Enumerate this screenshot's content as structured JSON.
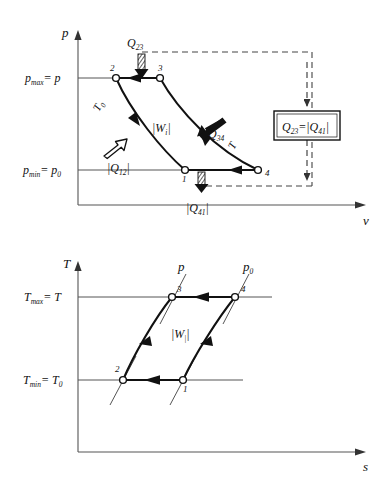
{
  "figure": {
    "type": "diagram",
    "background": "#ffffff",
    "line_color": "#111111",
    "dash_color": "#444444",
    "axis_color": "#555555"
  },
  "pv_chart": {
    "name": "p-v diagram",
    "x_axis_label": "v",
    "y_axis_label": "p",
    "y_ticks": [
      {
        "id": "pmax",
        "text_main": "p",
        "text_sub": "max",
        "text_eq": "= p",
        "value_y": 78
      },
      {
        "id": "pmin",
        "text_main": "p",
        "text_sub": "min",
        "text_eq": "= p",
        "text_eq_sub": "0",
        "value_y": 170
      }
    ],
    "points": [
      {
        "label": "2",
        "x": 116,
        "y": 78
      },
      {
        "label": "3",
        "x": 160,
        "y": 78
      },
      {
        "label": "1",
        "x": 185,
        "y": 170
      },
      {
        "label": "4",
        "x": 258,
        "y": 170
      }
    ],
    "curve_labels": [
      {
        "id": "T0-isotherm",
        "main": "T",
        "sub": "0",
        "x": 97,
        "y": 108,
        "rotate": -62
      },
      {
        "id": "T-isotherm",
        "main": "T",
        "sub": "",
        "x": 236,
        "y": 143,
        "rotate": -62
      },
      {
        "id": "work",
        "main": "|W",
        "sub": "i",
        "tail": "|",
        "x": 152,
        "y": 127
      },
      {
        "id": "heat-34",
        "main": "Q",
        "sub": "34",
        "x": 207,
        "y": 133
      },
      {
        "id": "heat-12",
        "main": "|Q",
        "sub": "12",
        "tail": "|",
        "x": 111,
        "y": 164
      },
      {
        "id": "heat-23",
        "main": "Q",
        "sub": "23",
        "x": 132,
        "y": 43
      },
      {
        "id": "heat-41",
        "main": "|Q",
        "sub": "41",
        "tail": "|",
        "x": 191,
        "y": 205
      }
    ],
    "equality_box": {
      "left": "Q",
      "left_sub": "23",
      "eq": "=",
      "right": "|Q",
      "right_sub": "41",
      "right_tail": "|",
      "x": 274,
      "y": 111,
      "w": 66,
      "h": 29
    }
  },
  "ts_chart": {
    "name": "T-s diagram",
    "x_axis_label": "s",
    "y_axis_label": "T",
    "y_ticks": [
      {
        "id": "Tmax",
        "text_main": "T",
        "text_sub": "max",
        "text_eq": "= T",
        "value_y": 297
      },
      {
        "id": "Tmin",
        "text_main": "T",
        "text_sub": "min",
        "text_eq": "= T",
        "text_eq_sub": "0",
        "value_y": 380
      }
    ],
    "points": [
      {
        "label": "2",
        "x": 123,
        "y": 380
      },
      {
        "label": "1",
        "x": 183,
        "y": 380
      },
      {
        "label": "3",
        "x": 172,
        "y": 297
      },
      {
        "label": "4",
        "x": 235,
        "y": 297
      }
    ],
    "isobar_labels": [
      {
        "id": "isobar-p",
        "main": "p",
        "sub": "",
        "x": 181,
        "y": 266
      },
      {
        "id": "isobar-p0",
        "main": "p",
        "sub": "0",
        "x": 248,
        "y": 266
      }
    ],
    "curve_labels": [
      {
        "id": "work",
        "main": "|W",
        "sub": "i",
        "tail": "|",
        "x": 173,
        "y": 333
      }
    ]
  }
}
